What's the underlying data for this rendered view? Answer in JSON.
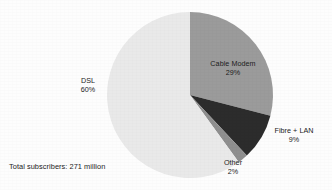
{
  "chart_data": {
    "type": "pie",
    "title": "",
    "subtitle": "",
    "xlabel": "",
    "ylabel": "",
    "legend_position": "none",
    "grid": false,
    "unit": "percent",
    "total_label": "Total subscribers: 271 million",
    "total_value": 271,
    "total_unit": "million",
    "categories": [
      "DSL",
      "Cable Modem",
      "Fibre + LAN",
      "Other"
    ],
    "values": [
      60,
      29,
      9,
      2
    ],
    "slices": [
      {
        "name": "DSL",
        "label": "DSL",
        "value": 60,
        "value_label": "60%",
        "color": "#e9e9e9",
        "start_angle_deg": 144,
        "sweep_deg": 216
      },
      {
        "name": "Cable Modem",
        "label": "Cable Modem",
        "value": 29,
        "value_label": "29%",
        "color": "#9b9b9b",
        "start_angle_deg": 0,
        "sweep_deg": 104.4
      },
      {
        "name": "Fibre + LAN",
        "label": "Fibre + LAN",
        "value": 9,
        "value_label": "9%",
        "color": "#2c2c2c",
        "start_angle_deg": 104.4,
        "sweep_deg": 32.4
      },
      {
        "name": "Other",
        "label": "Other",
        "value": 2,
        "value_label": "2%",
        "color": "#8f8f8f",
        "start_angle_deg": 136.8,
        "sweep_deg": 7.2
      }
    ]
  },
  "labels": {
    "cable_modem": {
      "name": "Cable Modem",
      "percent": "29%"
    },
    "dsl": {
      "name": "DSL",
      "percent": "60%"
    },
    "fibre_lan": {
      "name": "Fibre + LAN",
      "percent": "9%"
    },
    "other": {
      "name": "Other",
      "percent": "2%"
    }
  },
  "caption": {
    "total_subscribers": "Total subscribers: 271 million"
  },
  "colors": {
    "background": "#fdfdfd",
    "text": "#1c1c1c",
    "dsl": "#e9e9e9",
    "cable_modem": "#9b9b9b",
    "fibre_lan": "#2c2c2c",
    "other": "#8f8f8f"
  }
}
